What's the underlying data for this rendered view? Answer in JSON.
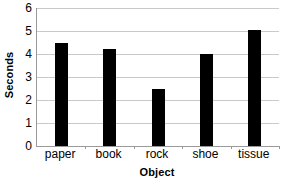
{
  "chart_data": {
    "type": "bar",
    "title": "",
    "categories": [
      "paper",
      "book",
      "rock",
      "shoe",
      "tissue"
    ],
    "values": [
      4.5,
      4.2,
      2.5,
      4.0,
      5.05
    ],
    "series": [
      {
        "name": "Seconds",
        "values": [
          4.5,
          4.2,
          2.5,
          4.0,
          5.05
        ]
      }
    ],
    "xlabel": "Object",
    "ylabel": "Seconds",
    "ylim": [
      0,
      6
    ],
    "ytick_labels": [
      "0",
      "1",
      "2",
      "3",
      "4",
      "5",
      "6"
    ],
    "ytick_values": [
      0,
      1,
      2,
      3,
      4,
      5,
      6
    ],
    "grid": "horizontal",
    "legend": "none",
    "bar_color": "#000000",
    "gridline_color": "#c9c9c9",
    "axis_color": "#9a9a9a",
    "background_color": "#ffffff"
  }
}
